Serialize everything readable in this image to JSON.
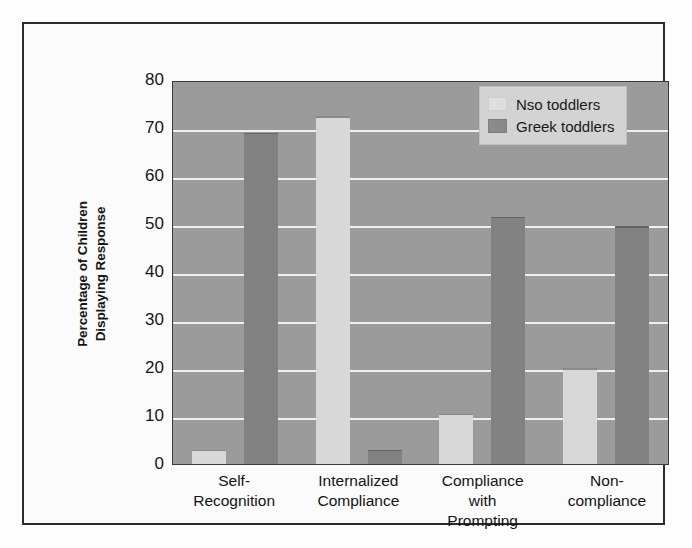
{
  "chart_data": {
    "type": "bar",
    "title": "",
    "xlabel": "",
    "ylabel": "Percentage of Children Displaying Response",
    "ylabel_lines": [
      "Percentage of Children",
      "Displaying Response"
    ],
    "ylim": [
      0,
      80
    ],
    "yticks": [
      80,
      70,
      60,
      50,
      40,
      30,
      20,
      10,
      0
    ],
    "ytick_labels": [
      "80",
      "70",
      "60",
      "50",
      "40",
      "30",
      "20",
      "10",
      "0"
    ],
    "grid": true,
    "legend_position": "top-right",
    "categories": [
      "Self-Recognition",
      "Internalized Compliance",
      "Compliance with Prompting",
      "Non-compliance"
    ],
    "category_lines": [
      [
        "Self-",
        "Recognition"
      ],
      [
        "Internalized",
        "Compliance"
      ],
      [
        "Compliance",
        "with",
        "Prompting"
      ],
      [
        "Non-",
        "compliance"
      ]
    ],
    "series": [
      {
        "name": "Nso toddlers",
        "color": "#d8d8d8",
        "values": [
          3,
          72.5,
          10.5,
          20
        ]
      },
      {
        "name": "Greek toddlers",
        "color": "#828282",
        "values": [
          69,
          3,
          51.5,
          49.5
        ]
      }
    ]
  },
  "legend": {
    "items": [
      {
        "label": "Nso toddlers",
        "swatch": "nso"
      },
      {
        "label": "Greek toddlers",
        "swatch": "greek"
      }
    ]
  },
  "colors": {
    "plot_background": "#9b9b9b",
    "gridline": "#f0f0f0",
    "page_background": "#fdfdfd",
    "frame": "#2c2c2c",
    "legend_background": "#d3d3d3",
    "nso_bar": "#d8d8d8",
    "greek_bar": "#828282"
  }
}
